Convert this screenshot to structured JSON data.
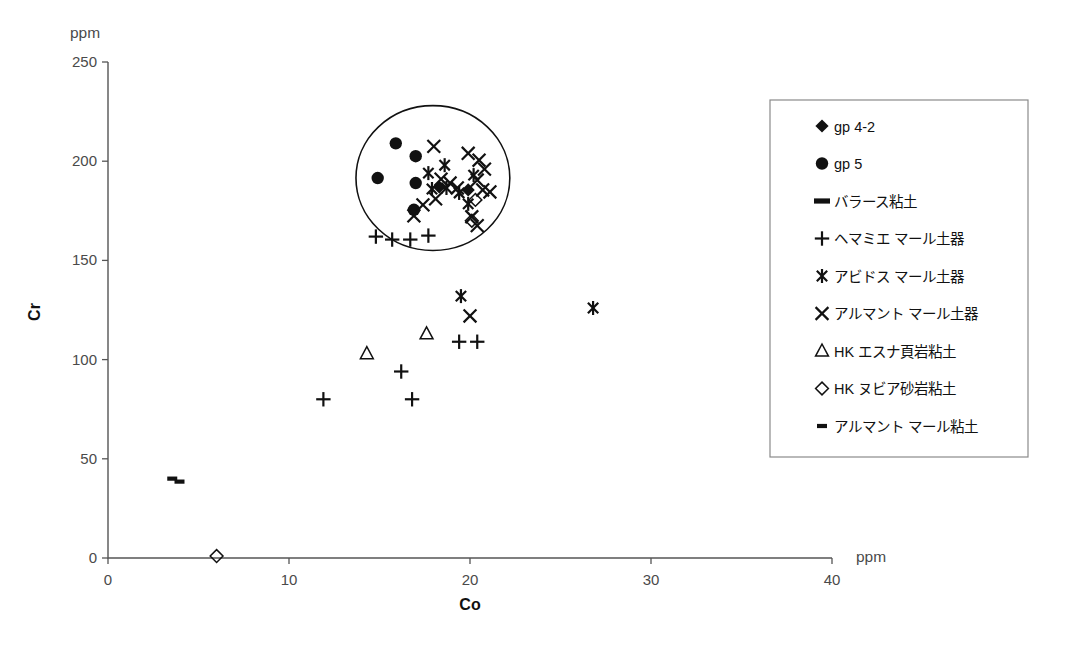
{
  "chart_data": {
    "type": "scatter",
    "title": "",
    "xlabel": "Co",
    "ylabel": "Cr",
    "x_unit": "ppm",
    "y_unit": "ppm",
    "xlim": [
      0,
      40
    ],
    "ylim": [
      0,
      250
    ],
    "xticks": [
      0,
      10,
      20,
      30,
      40
    ],
    "yticks": [
      0,
      50,
      100,
      150,
      200,
      250
    ],
    "xtick_labels": [
      "0",
      "10",
      "20",
      "30",
      "40"
    ],
    "ytick_labels": [
      "0",
      "50",
      "100",
      "150",
      "200",
      "250"
    ],
    "grid": false,
    "legend_position": "right",
    "annotations": [
      {
        "kind": "ellipse",
        "label": "cluster-circle",
        "cx": 17.95,
        "cy": 191.5,
        "rx": 4.25,
        "ry": 36.5
      }
    ],
    "series": [
      {
        "name": "gp 4-2",
        "marker": "filled-diamond",
        "points": [
          {
            "x": 19.9,
            "y": 185.5
          },
          {
            "x": 18.3,
            "y": 187.0
          }
        ]
      },
      {
        "name": "gp 5",
        "marker": "filled-circle",
        "points": [
          {
            "x": 15.9,
            "y": 209.0
          },
          {
            "x": 17.0,
            "y": 202.5
          },
          {
            "x": 14.9,
            "y": 191.5
          },
          {
            "x": 17.0,
            "y": 189.0
          },
          {
            "x": 16.9,
            "y": 175.5
          }
        ]
      },
      {
        "name": "バラース粘土",
        "marker": "thick-dash",
        "points": []
      },
      {
        "name": "ヘマミエ マール土器",
        "marker": "plus",
        "points": [
          {
            "x": 14.8,
            "y": 162.0
          },
          {
            "x": 15.7,
            "y": 160.5
          },
          {
            "x": 16.7,
            "y": 160.5
          },
          {
            "x": 17.7,
            "y": 162.5
          },
          {
            "x": 19.4,
            "y": 109.0
          },
          {
            "x": 20.4,
            "y": 109.0
          },
          {
            "x": 16.2,
            "y": 94.0
          },
          {
            "x": 11.9,
            "y": 80.0
          },
          {
            "x": 16.8,
            "y": 80.0
          }
        ]
      },
      {
        "name": "アビドス マール土器",
        "marker": "asterisk",
        "points": [
          {
            "x": 17.7,
            "y": 194.0
          },
          {
            "x": 18.6,
            "y": 198.0
          },
          {
            "x": 17.9,
            "y": 186.0
          },
          {
            "x": 18.7,
            "y": 186.5
          },
          {
            "x": 19.4,
            "y": 184.0
          },
          {
            "x": 19.9,
            "y": 178.5
          },
          {
            "x": 20.2,
            "y": 193.0
          },
          {
            "x": 19.5,
            "y": 132.0
          },
          {
            "x": 26.8,
            "y": 126.0
          }
        ]
      },
      {
        "name": "アルマント マール土器",
        "marker": "cross",
        "points": [
          {
            "x": 18.0,
            "y": 207.5
          },
          {
            "x": 19.9,
            "y": 204.0
          },
          {
            "x": 20.5,
            "y": 200.5
          },
          {
            "x": 20.8,
            "y": 196.0
          },
          {
            "x": 20.4,
            "y": 190.5
          },
          {
            "x": 18.4,
            "y": 191.0
          },
          {
            "x": 18.9,
            "y": 189.0
          },
          {
            "x": 19.3,
            "y": 186.5
          },
          {
            "x": 20.7,
            "y": 185.5
          },
          {
            "x": 21.1,
            "y": 184.5
          },
          {
            "x": 18.1,
            "y": 181.0
          },
          {
            "x": 17.4,
            "y": 178.0
          },
          {
            "x": 16.9,
            "y": 172.5
          },
          {
            "x": 20.1,
            "y": 172.0
          },
          {
            "x": 20.4,
            "y": 167.5
          },
          {
            "x": 20.0,
            "y": 122.0
          }
        ]
      },
      {
        "name": "HK エスナ頁岩粘土",
        "marker": "open-triangle",
        "points": [
          {
            "x": 17.6,
            "y": 113.0
          },
          {
            "x": 14.3,
            "y": 103.0
          }
        ]
      },
      {
        "name": "HK ヌビア砂岩粘土",
        "marker": "open-diamond",
        "points": [
          {
            "x": 20.3,
            "y": 180.5
          },
          {
            "x": 20.1,
            "y": 170.0
          },
          {
            "x": 6.0,
            "y": 1.0
          }
        ]
      },
      {
        "name": "アルマント マール粘土",
        "marker": "small-dash",
        "points": [
          {
            "x": 3.55,
            "y": 40.0
          },
          {
            "x": 3.95,
            "y": 38.5
          }
        ]
      }
    ]
  },
  "legend": {
    "items": [
      {
        "label": "gp 4-2",
        "marker": "filled-diamond"
      },
      {
        "label": "gp 5",
        "marker": "filled-circle"
      },
      {
        "label": "バラース粘土",
        "marker": "thick-dash"
      },
      {
        "label": "ヘマミエ マール土器",
        "marker": "plus"
      },
      {
        "label": "アビドス マール土器",
        "marker": "asterisk"
      },
      {
        "label": "アルマント マール土器",
        "marker": "cross"
      },
      {
        "label": "HK エスナ頁岩粘土",
        "marker": "open-triangle"
      },
      {
        "label": "HK ヌビア砂岩粘土",
        "marker": "open-diamond"
      },
      {
        "label": "アルマント マール粘土",
        "marker": "small-dash"
      }
    ]
  },
  "colors": {
    "ink": "#111111",
    "axis": "#555555",
    "tick_text": "#4a4a4a",
    "legend_border": "#8a8a8a",
    "background": "#ffffff"
  }
}
